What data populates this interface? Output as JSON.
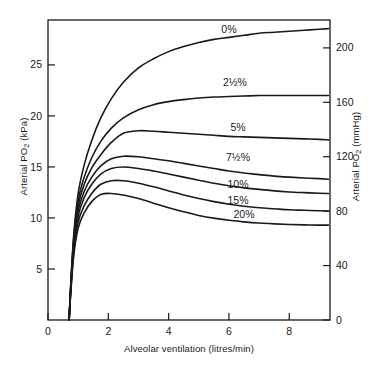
{
  "chart_data": {
    "type": "line",
    "title": "",
    "subtitle": "",
    "xlabel": "Alveolar ventilation (litres/min)",
    "ylabel": "Arterial PO2 (kPa)",
    "ylabel_right": "Arterial PO2 (mmHg)",
    "xlabel_parts": {
      "text": "Alveolar ventilation (litres/min)"
    },
    "ylabel_parts": {
      "pre": "Arterial PO",
      "sub": "2",
      "post": " (kPa)"
    },
    "ylabel_right_parts": {
      "pre": "Arterial PO",
      "sub": "2",
      "post": " (mmHg)"
    },
    "xlim": [
      0,
      9.35
    ],
    "ylim": [
      0,
      29.4
    ],
    "ylim_right_mmHg": [
      0,
      220.5
    ],
    "grid": false,
    "legend_position": "inline-curve-labels",
    "xticks": [
      0,
      2,
      4,
      6,
      8
    ],
    "xticklabels": [
      "0",
      "2",
      "4",
      "6",
      "8"
    ],
    "yticks": [
      5,
      10,
      15,
      20,
      25
    ],
    "yticklabels": [
      "5",
      "10",
      "15",
      "20",
      "25"
    ],
    "yticks_right_mmHg": [
      0,
      40,
      80,
      120,
      160,
      200
    ],
    "yticklabels_right": [
      "0",
      "40",
      "80",
      "120",
      "160",
      "200"
    ],
    "unit_conversion_note": "1 kPa = 7.5 mmHg",
    "x": [
      0.7,
      0.75,
      0.85,
      1.0,
      1.2,
      1.45,
      1.75,
      2.1,
      2.5,
      3.0,
      3.5,
      4.0,
      4.5,
      5.0,
      5.5,
      6.0,
      6.5,
      7.0,
      7.5,
      8.0,
      8.5,
      9.0,
      9.3
    ],
    "series": [
      {
        "name": "0%",
        "label": "0%",
        "color": "#1a1a1a",
        "label_x": 6.0,
        "label_y": 28.1,
        "values": [
          0.0,
          3.2,
          8.2,
          12.4,
          15.2,
          17.6,
          19.8,
          21.7,
          23.3,
          24.7,
          25.6,
          26.3,
          26.8,
          27.2,
          27.5,
          27.7,
          27.9,
          28.1,
          28.2,
          28.3,
          28.4,
          28.5,
          28.55
        ]
      },
      {
        "name": "2.5%",
        "label": "2½%",
        "color": "#1a1a1a",
        "label_x": 6.2,
        "label_y": 22.9,
        "values": [
          0.0,
          3.1,
          7.9,
          11.7,
          14.0,
          15.9,
          17.5,
          18.8,
          19.8,
          20.6,
          21.1,
          21.4,
          21.6,
          21.75,
          21.85,
          21.9,
          21.95,
          22.0,
          22.0,
          22.0,
          22.0,
          22.0,
          22.0
        ]
      },
      {
        "name": "5%",
        "label": "5%",
        "color": "#1a1a1a",
        "label_x": 6.3,
        "label_y": 18.5,
        "values": [
          0.0,
          3.0,
          7.6,
          11.2,
          13.3,
          14.9,
          16.2,
          17.4,
          18.3,
          18.55,
          18.5,
          18.4,
          18.3,
          18.2,
          18.1,
          18.0,
          17.95,
          17.9,
          17.85,
          17.8,
          17.75,
          17.7,
          17.65
        ]
      },
      {
        "name": "7.5%",
        "label": "7½%",
        "color": "#1a1a1a",
        "label_x": 6.3,
        "label_y": 15.6,
        "values": [
          0.0,
          2.9,
          7.3,
          10.7,
          12.6,
          14.0,
          15.1,
          15.8,
          16.05,
          16.0,
          15.8,
          15.6,
          15.35,
          15.1,
          14.85,
          14.6,
          14.4,
          14.25,
          14.1,
          14.0,
          13.92,
          13.85,
          13.8
        ]
      },
      {
        "name": "10%",
        "label": "10%",
        "color": "#1a1a1a",
        "label_x": 6.3,
        "label_y": 12.9,
        "values": [
          0.0,
          2.8,
          7.0,
          10.2,
          12.0,
          13.3,
          14.3,
          14.85,
          15.0,
          14.85,
          14.6,
          14.3,
          14.0,
          13.7,
          13.4,
          13.15,
          12.95,
          12.8,
          12.65,
          12.55,
          12.48,
          12.42,
          12.4
        ]
      },
      {
        "name": "15%",
        "label": "15%",
        "color": "#1a1a1a",
        "label_x": 6.3,
        "label_y": 11.4,
        "values": [
          0.0,
          2.6,
          6.6,
          9.6,
          11.2,
          12.4,
          13.3,
          13.65,
          13.65,
          13.4,
          13.05,
          12.65,
          12.25,
          11.9,
          11.6,
          11.35,
          11.15,
          11.0,
          10.9,
          10.8,
          10.75,
          10.7,
          10.68
        ]
      },
      {
        "name": "20%",
        "label": "20%",
        "color": "#1a1a1a",
        "label_x": 6.5,
        "label_y": 10.0,
        "values": [
          0.0,
          2.4,
          6.2,
          9.0,
          10.5,
          11.6,
          12.3,
          12.4,
          12.25,
          11.9,
          11.45,
          11.0,
          10.6,
          10.25,
          9.98,
          9.78,
          9.62,
          9.5,
          9.42,
          9.36,
          9.32,
          9.3,
          9.3
        ]
      }
    ]
  },
  "figure": {
    "background_color": "#ffffff",
    "axis_color": "#1a1a1a",
    "curve_color": "#1a1a1a"
  }
}
